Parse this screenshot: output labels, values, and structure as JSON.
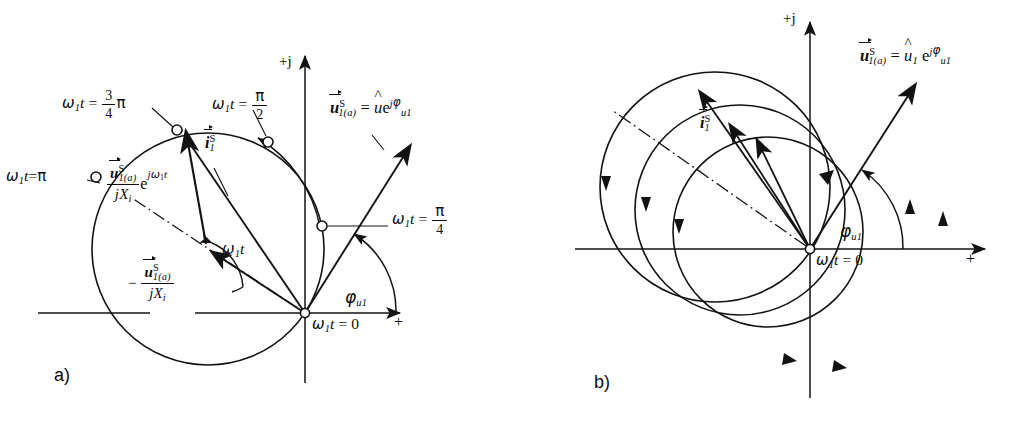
{
  "figure": {
    "background": "#ffffff",
    "stroke": "#121212",
    "width": 1011,
    "height": 425
  },
  "panel_a": {
    "tag": "a)",
    "axes": {
      "imaginary_label": "+j",
      "real_label": "+",
      "origin_label_parts": {
        "omega": "ω",
        "one": "1",
        "t": "t",
        "eq": "= 0"
      }
    },
    "labels": {
      "omega_t_pi": {
        "lhs_omega": "ω",
        "lhs_sub": "1",
        "lhs_t": "t",
        "eq": "=",
        "value": "π"
      },
      "omega_t_3pi4": {
        "lhs_omega": "ω",
        "lhs_sub": "1",
        "lhs_t": "t",
        "eq": "=",
        "num": "3",
        "den": "4",
        "pi": "π"
      },
      "omega_t_pi2": {
        "lhs_omega": "ω",
        "lhs_sub": "1",
        "lhs_t": "t",
        "eq": "=",
        "num": "π",
        "den": "2"
      },
      "omega_t_pi4": {
        "lhs_omega": "ω",
        "lhs_sub": "1",
        "lhs_t": "t",
        "eq": "=",
        "num": "π",
        "den": "4"
      },
      "voltage_vector": {
        "u": "u",
        "sup_S": "S",
        "sub_1a": "1(a)",
        "eq": "=",
        "hat_u": "u",
        "e": "e",
        "exp_j": "j",
        "exp_phi": "φ",
        "exp_sub": "u1"
      },
      "current_vector": {
        "i": "i",
        "sup_S": "S",
        "sub_1": "1"
      },
      "rotating_term": {
        "num_u": "u",
        "num_sup": "S",
        "num_sub": "1(a)",
        "den_j": "j",
        "den_X": "X",
        "den_sub": "i",
        "e": "e",
        "exp_j": "j",
        "exp_omega": "ω",
        "exp_sub": "1",
        "exp_t": "t"
      },
      "offset_term": {
        "minus": "−",
        "num_u": "u",
        "num_sup": "S",
        "num_sub": "1(a)",
        "den_j": "j",
        "den_X": "X",
        "den_sub": "i"
      },
      "angle_arc": {
        "omega": "ω",
        "sub": "1",
        "t": "t"
      },
      "phase_angle": {
        "phi": "φ",
        "sub": "u1"
      }
    }
  },
  "panel_b": {
    "tag": "b)",
    "axes": {
      "imaginary_label": "+j",
      "real_label": "+",
      "origin_label_parts": {
        "omega": "ω",
        "one": "1",
        "t": "t",
        "eq": "= 0"
      }
    },
    "labels": {
      "voltage_vector": {
        "u": "u",
        "sup_S": "S",
        "sub_1a": "1(a)",
        "eq": "=",
        "hat_u": "u",
        "hat_sub": "1",
        "e": "e",
        "exp_j": "j",
        "exp_phi": "φ",
        "exp_sub": "u1"
      },
      "current_vector": {
        "i": "i",
        "sup_S": "S",
        "sub_1": "1"
      },
      "phase_angle": {
        "phi": "φ",
        "sub": "u1"
      }
    }
  },
  "geometry": {
    "panel_a": {
      "origin": [
        305,
        313
      ],
      "circle_center": [
        208,
        249
      ],
      "circle_radius": 116,
      "markers": [
        {
          "name": "pi-over-4",
          "x": 322,
          "y": 226
        },
        {
          "name": "pi-over-2",
          "x": 268,
          "y": 142
        },
        {
          "name": "three-pi-over-4",
          "x": 177,
          "y": 130
        },
        {
          "name": "pi",
          "x": 96,
          "y": 177
        }
      ]
    },
    "panel_b": {
      "origin": [
        810,
        249
      ],
      "circles": [
        {
          "cx": 715,
          "cy": 187,
          "r": 115
        },
        {
          "cx": 740,
          "cy": 210,
          "r": 105
        },
        {
          "cx": 768,
          "cy": 232,
          "r": 95
        }
      ]
    }
  }
}
